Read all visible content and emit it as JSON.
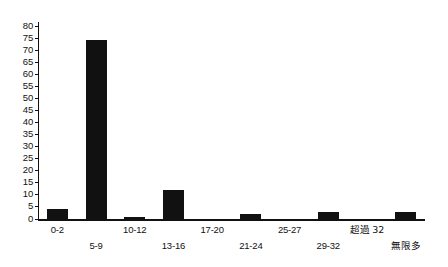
{
  "chart_data": {
    "type": "bar",
    "title": "",
    "subtitle": "",
    "xlabel": "",
    "ylabel": "",
    "categories": [
      "0-2",
      "5-9",
      "10-12",
      "13-16",
      "17-20",
      "21-24",
      "25-27",
      "29-32",
      "超過 32",
      "無限多"
    ],
    "values": [
      4,
      74,
      1,
      12,
      0,
      2,
      0,
      3,
      0,
      3
    ],
    "ylim": [
      0,
      80
    ],
    "y_ticks": [
      0,
      5,
      10,
      15,
      20,
      25,
      30,
      35,
      40,
      45,
      50,
      55,
      60,
      65,
      70,
      75,
      80
    ],
    "x_tick_labels": [
      "0-2",
      "5-9",
      "10-12",
      "13-16",
      "17-20",
      "21-24",
      "25-27",
      "29-32",
      "超過 32",
      "無限多"
    ],
    "legend": [],
    "legend_position": "none",
    "grid": false,
    "bar_color": "#111111",
    "axis_color": "#111111",
    "background": "#ffffff"
  },
  "axis": {
    "y_labels": [
      "80",
      "75",
      "70",
      "65",
      "60",
      "55",
      "50",
      "45",
      "40",
      "35",
      "30",
      "25",
      "20",
      "15",
      "10",
      "5",
      "0"
    ]
  },
  "x_labels_top": [
    "0-2",
    "10-12",
    "17-20",
    "25-27",
    "超過 32"
  ],
  "x_labels_bottom": [
    "5-9",
    "13-16",
    "21-24",
    "29-32",
    "無限多"
  ]
}
